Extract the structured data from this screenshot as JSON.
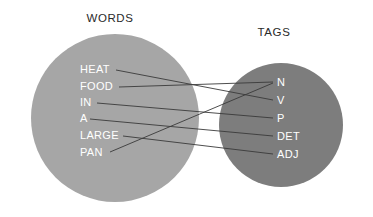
{
  "canvas": {
    "width": 373,
    "height": 217,
    "background": "#ffffff"
  },
  "diagram": {
    "type": "bipartite-mapping",
    "caption_left": "WORDS",
    "caption_right": "TAGS"
  },
  "sets": {
    "left": {
      "title": "WORDS",
      "title_x": 110,
      "title_y": 22,
      "circle": {
        "cx": 115,
        "cy": 118,
        "r": 84,
        "fill": "#a6a6a6"
      },
      "items": [
        {
          "label": "HEAT",
          "x": 80,
          "y": 73,
          "anchor_x": 116,
          "anchor_y": 70
        },
        {
          "label": "FOOD",
          "x": 80,
          "y": 90,
          "anchor_x": 119,
          "anchor_y": 87
        },
        {
          "label": "IN",
          "x": 80,
          "y": 106,
          "anchor_x": 97,
          "anchor_y": 103
        },
        {
          "label": "A",
          "x": 80,
          "y": 122,
          "anchor_x": 90,
          "anchor_y": 119
        },
        {
          "label": "LARGE",
          "x": 80,
          "y": 139,
          "anchor_x": 123,
          "anchor_y": 136
        },
        {
          "label": "PAN",
          "x": 80,
          "y": 156,
          "anchor_x": 110,
          "anchor_y": 152
        }
      ]
    },
    "right": {
      "title": "TAGS",
      "title_x": 274,
      "title_y": 36,
      "circle": {
        "cx": 281,
        "cy": 125,
        "r": 62,
        "fill": "#7d7d7d"
      },
      "items": [
        {
          "label": "N",
          "x": 277,
          "y": 86,
          "anchor_x": 273,
          "anchor_y": 82
        },
        {
          "label": "V",
          "x": 277,
          "y": 104,
          "anchor_x": 273,
          "anchor_y": 100
        },
        {
          "label": "P",
          "x": 277,
          "y": 122,
          "anchor_x": 273,
          "anchor_y": 118
        },
        {
          "label": "DET",
          "x": 277,
          "y": 140,
          "anchor_x": 273,
          "anchor_y": 136
        },
        {
          "label": "ADJ",
          "x": 277,
          "y": 158,
          "anchor_x": 273,
          "anchor_y": 154
        }
      ]
    }
  },
  "edges": [
    {
      "from": "HEAT",
      "to": "V",
      "x1": 116,
      "y1": 70,
      "x2": 273,
      "y2": 100
    },
    {
      "from": "FOOD",
      "to": "N",
      "x1": 119,
      "y1": 87,
      "x2": 273,
      "y2": 82
    },
    {
      "from": "IN",
      "to": "P",
      "x1": 97,
      "y1": 103,
      "x2": 273,
      "y2": 118
    },
    {
      "from": "A",
      "to": "DET",
      "x1": 90,
      "y1": 119,
      "x2": 273,
      "y2": 136
    },
    {
      "from": "LARGE",
      "to": "ADJ",
      "x1": 123,
      "y1": 136,
      "x2": 273,
      "y2": 154
    },
    {
      "from": "PAN",
      "to": "N",
      "x1": 110,
      "y1": 152,
      "x2": 273,
      "y2": 83
    }
  ],
  "colors": {
    "left_circle": "#a6a6a6",
    "right_circle": "#7d7d7d",
    "edge": "#3a3a3a",
    "node_text": "#ffffff",
    "title_text": "#2a2a2a",
    "background": "#ffffff"
  }
}
